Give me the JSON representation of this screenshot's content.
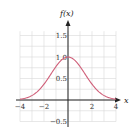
{
  "chart_data": {
    "type": "line",
    "title": "",
    "xlabel": "x",
    "ylabel": "f(x)",
    "xlim": [
      -4,
      4
    ],
    "ylim": [
      -0.5,
      1.5
    ],
    "grid": true,
    "x_ticks": [
      "-4",
      "-2",
      "2",
      "4"
    ],
    "y_ticks": [
      "1.5",
      "1.0",
      "0.5",
      "-0.5"
    ],
    "series": [
      {
        "name": "f(x)",
        "color": "#d0607a",
        "x": [
          -4,
          -3.5,
          -3,
          -2.5,
          -2,
          -1.5,
          -1,
          -0.5,
          0,
          0.5,
          1,
          1.5,
          2,
          2.5,
          3,
          3.5,
          4
        ],
        "y": [
          0.02,
          0.05,
          0.11,
          0.21,
          0.37,
          0.57,
          0.78,
          0.94,
          1.0,
          0.94,
          0.78,
          0.57,
          0.37,
          0.21,
          0.11,
          0.05,
          0.02
        ]
      }
    ]
  }
}
